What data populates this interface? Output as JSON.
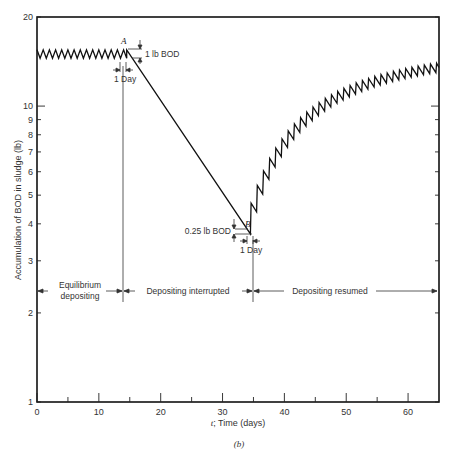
{
  "chart_data": {
    "type": "line",
    "title": "",
    "caption": "(b)",
    "xlabel_var": "t",
    "xlabel": "; Time (days)",
    "ylabel": "Accumulation of BOD in sludge   (lb)",
    "xlim": [
      0,
      65
    ],
    "ylim": [
      1,
      20
    ],
    "yscale": "log",
    "grid": false,
    "x_ticks": [
      0,
      10,
      20,
      30,
      40,
      50,
      60
    ],
    "x_minor_ticks": [
      5,
      15,
      25,
      35,
      45,
      55
    ],
    "y_ticks": [
      1,
      2,
      3,
      4,
      5,
      6,
      7,
      8,
      9,
      10,
      20
    ],
    "y_tick_labels": [
      "1",
      "2",
      "3",
      "4",
      "5",
      "6",
      "7",
      "8",
      "9",
      "10",
      "20"
    ],
    "phases": [
      {
        "name": "Equilibrium depositing",
        "label_line1": "Equilibrium",
        "label_line2": "depositing",
        "start_day": 0,
        "end_day": 14.5
      },
      {
        "name": "Depositing interrupted",
        "label_line1": "Depositing interrupted",
        "start_day": 14.5,
        "end_day": 35
      },
      {
        "name": "Depositing resumed",
        "label_line1": "Depositing resumed",
        "start_day": 35,
        "end_day": 65
      }
    ],
    "series": [
      {
        "name": "BOD accumulation",
        "equilibrium": {
          "days": [
            0,
            14.5
          ],
          "peak_lb": 15.5,
          "trough_lb": 14.5,
          "period_days": 1
        },
        "interrupted": {
          "start": {
            "day": 14.5,
            "lb": 15.5
          },
          "end": {
            "day": 34.5,
            "lb": 3.7
          }
        },
        "resumed": {
          "start_day": 34.5,
          "start_lb": 3.7,
          "daily_deposit_lb": 1.0,
          "daily_retention": 0.935,
          "end_day": 65,
          "end_trough_lb": 13.1,
          "end_peak_lb": 14.1
        }
      }
    ],
    "annotations": {
      "point_a": {
        "label": "A",
        "day": 14.5,
        "lb": 15.5
      },
      "point_b": {
        "label": "B",
        "day": 34.5,
        "lb": 3.7
      },
      "a_height": "1 lb BOD",
      "a_width": "1 Day",
      "b_height": "0.25 lb BOD",
      "b_width": "1 Day"
    }
  },
  "labels": {
    "a_point": "A",
    "b_point": "B",
    "a_height": "1 lb BOD",
    "a_width": "1 Day",
    "b_height": "0.25 lb BOD",
    "b_width": "1 Day",
    "phase1_line1": "Equilibrium",
    "phase1_line2": "depositing",
    "phase2": "Depositing interrupted",
    "phase3": "Depositing resumed",
    "xlabel_var": "t",
    "xlabel": "; Time  (days)",
    "ylabel": "Accumulation of BOD in sludge   (lb)",
    "caption": "(b)"
  }
}
